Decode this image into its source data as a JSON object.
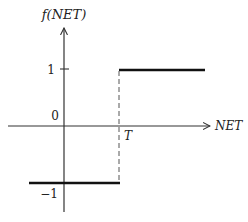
{
  "diagram": {
    "y_axis_label": "f(NET)",
    "x_axis_label": "NET",
    "origin_label": "0",
    "threshold_label": "T",
    "y_tick_high": "1",
    "y_tick_low": "−1",
    "colors": {
      "axis": "#333333",
      "step": "#111111",
      "dashed": "#555555",
      "text": "#222222"
    }
  }
}
